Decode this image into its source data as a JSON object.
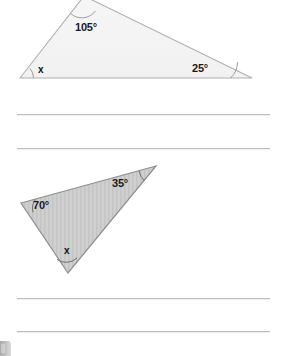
{
  "page": {
    "background_color": "#ffffff",
    "width": 287,
    "height": 356
  },
  "figures": [
    {
      "name": "triangle-1",
      "description": "Obtuse triangle clipped at top edge of page",
      "fill_color": "#f4f4f4",
      "stroke_color": "#b0b0b0",
      "vertices": [
        {
          "name": "left",
          "x": 20,
          "y": 78
        },
        {
          "name": "top",
          "x": 84,
          "y": -4
        },
        {
          "name": "right",
          "x": 252,
          "y": 78
        }
      ],
      "labels": [
        {
          "name": "angle-105",
          "text": "105°",
          "x": 75,
          "y": 21
        },
        {
          "name": "angle-x",
          "text": "x",
          "x": 38,
          "y": 64
        },
        {
          "name": "angle-25",
          "text": "25°",
          "x": 192,
          "y": 62
        }
      ],
      "arc_marks": [
        {
          "at": "left"
        },
        {
          "at": "top"
        },
        {
          "at": "right"
        }
      ]
    },
    {
      "name": "triangle-2",
      "description": "Scalene triangle with vertical hatch fill",
      "fill_color": "#cfcfcf",
      "stroke_color": "#8f8f8f",
      "vertices": [
        {
          "name": "left",
          "x": 21,
          "y": 203
        },
        {
          "name": "top-right",
          "x": 156,
          "y": 166
        },
        {
          "name": "bottom",
          "x": 68,
          "y": 273
        }
      ],
      "labels": [
        {
          "name": "angle-70",
          "text": "70°",
          "x": 33,
          "y": 199
        },
        {
          "name": "angle-35",
          "text": "35°",
          "x": 112,
          "y": 177
        },
        {
          "name": "angle-x",
          "text": "x",
          "x": 64,
          "y": 245
        }
      ],
      "arc_marks": [
        {
          "at": "left"
        },
        {
          "at": "top-right"
        },
        {
          "at": "bottom"
        }
      ]
    }
  ],
  "ruled_lines": [
    {
      "name": "answer-line-1",
      "x": 17,
      "y": 114,
      "width": 253
    },
    {
      "name": "answer-line-2",
      "x": 17,
      "y": 148,
      "width": 253
    },
    {
      "name": "answer-line-3",
      "x": 17,
      "y": 298,
      "width": 253
    },
    {
      "name": "answer-line-4",
      "x": 17,
      "y": 331,
      "width": 253
    }
  ],
  "corner_glyph": {
    "name": "clipped-corner-glyph",
    "color": "#a8a8a8"
  }
}
